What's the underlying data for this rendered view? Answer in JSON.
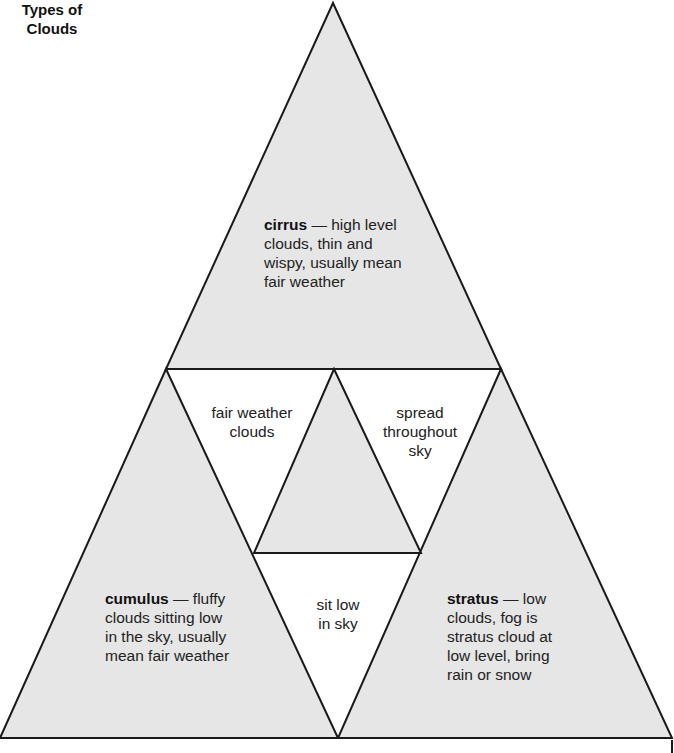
{
  "diagram": {
    "title": {
      "line1": "Types of",
      "line2": "Clouds"
    },
    "colors": {
      "fill": "#e6e6e6",
      "stroke": "#1a1a1a",
      "background": "#ffffff"
    },
    "types": [
      {
        "id": "cirrus",
        "name": "cirrus",
        "dash": " — ",
        "desc_line1": "high level",
        "line2": "clouds, thin and",
        "line3": "wispy, usually mean",
        "line4": "fair weather"
      },
      {
        "id": "cumulus",
        "name": "cumulus",
        "dash": " — ",
        "desc_line1": "fluffy",
        "line2": "clouds sitting low",
        "line3": "in the sky, usually",
        "line4": "mean fair weather"
      },
      {
        "id": "stratus",
        "name": "stratus",
        "dash": " — ",
        "desc_line1": "low",
        "line2": "clouds, fog is",
        "line3": "stratus cloud at",
        "line4": "low level, bring",
        "line5": "rain or snow"
      }
    ],
    "connections": [
      {
        "between": "cirrus-cumulus",
        "line1": "fair weather",
        "line2": "clouds"
      },
      {
        "between": "cirrus-stratus",
        "line1": "spread",
        "line2": "throughout",
        "line3": "sky"
      },
      {
        "between": "cumulus-stratus",
        "line1": "sit low",
        "line2": "in sky"
      }
    ]
  }
}
